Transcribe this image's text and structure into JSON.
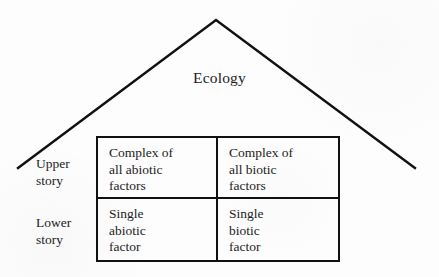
{
  "figure": {
    "roof_title": "Ecology",
    "side_labels": [
      {
        "id": "upper",
        "line1": "Upper",
        "line2": "story"
      },
      {
        "id": "lower",
        "line1": "Lower",
        "line2": "story"
      }
    ],
    "table": {
      "rows": [
        {
          "row_label": "Upper story",
          "cells": [
            {
              "id": "upper-abiotic",
              "line1": "Complex of",
              "line2": "all abiotic",
              "line3": "factors"
            },
            {
              "id": "upper-biotic",
              "line1": "Complex of",
              "line2": "all biotic",
              "line3": "factors"
            }
          ]
        },
        {
          "row_label": "Lower story",
          "cells": [
            {
              "id": "lower-abiotic",
              "line1": "Single",
              "line2": "abiotic",
              "line3": "factor"
            },
            {
              "id": "lower-biotic",
              "line1": "Single",
              "line2": "biotic",
              "line3": "factor"
            }
          ]
        }
      ]
    },
    "colors": {
      "ink": "#111111",
      "text": "#1c1c1c",
      "paper": "#fdfdfd"
    }
  }
}
